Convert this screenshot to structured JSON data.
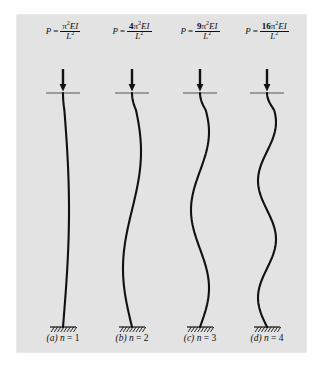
{
  "figure": {
    "background_color": "#e3e3e3",
    "page_color": "#ffffff",
    "curve_color": "#111111",
    "columns": [
      {
        "id": "mode-1",
        "formula": {
          "lhs": "P",
          "equals": "=",
          "coefficient": "",
          "numerator_symbol": "π",
          "numerator_exponent": "2",
          "numerator_terms": "EI",
          "denominator_symbol": "L",
          "denominator_exponent": "2",
          "plain": "P = π²EI / L²"
        },
        "caption_label": "(a)",
        "caption_var": "n",
        "caption_equals": "=",
        "caption_value": "1",
        "mode_number": 1,
        "load_arrow": "down-arrow"
      },
      {
        "id": "mode-2",
        "formula": {
          "lhs": "P",
          "equals": "=",
          "coefficient": "4",
          "numerator_symbol": "π",
          "numerator_exponent": "2",
          "numerator_terms": "EI",
          "denominator_symbol": "L",
          "denominator_exponent": "2",
          "plain": "P = 4π²EI / L²"
        },
        "caption_label": "(b)",
        "caption_var": "n",
        "caption_equals": "=",
        "caption_value": "2",
        "mode_number": 2,
        "load_arrow": "down-arrow"
      },
      {
        "id": "mode-3",
        "formula": {
          "lhs": "P",
          "equals": "=",
          "coefficient": "9",
          "numerator_symbol": "π",
          "numerator_exponent": "2",
          "numerator_terms": "EI",
          "denominator_symbol": "L",
          "denominator_exponent": "2",
          "plain": "P = 9π²EI / L²"
        },
        "caption_label": "(c)",
        "caption_var": "n",
        "caption_equals": "=",
        "caption_value": "3",
        "mode_number": 3,
        "load_arrow": "down-arrow"
      },
      {
        "id": "mode-4",
        "formula": {
          "lhs": "P",
          "equals": "=",
          "coefficient": "16",
          "numerator_symbol": "π",
          "numerator_exponent": "2",
          "numerator_terms": "EI",
          "denominator_symbol": "L",
          "denominator_exponent": "2",
          "plain": "P = 16π²EI / L²"
        },
        "caption_label": "(d)",
        "caption_var": "n",
        "caption_equals": "=",
        "caption_value": "4",
        "mode_number": 4,
        "load_arrow": "down-arrow"
      }
    ]
  },
  "chart_data": {
    "type": "line",
    "xlabel": "",
    "ylabel": "",
    "series": [
      {
        "name": "(a) n = 1",
        "mode": 1,
        "amplitude": 6,
        "half_waves": 1
      },
      {
        "name": "(b) n = 2",
        "mode": 2,
        "amplitude": 9,
        "half_waves": 2
      },
      {
        "name": "(c) n = 3",
        "mode": 3,
        "amplitude": 9,
        "half_waves": 3
      },
      {
        "name": "(d) n = 4",
        "mode": 4,
        "amplitude": 9,
        "half_waves": 4
      }
    ],
    "column_top_y": 78,
    "column_base_y": 312,
    "legend": "none",
    "grid": false
  }
}
